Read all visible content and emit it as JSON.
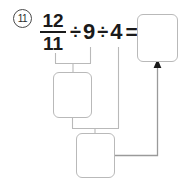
{
  "problem": {
    "number": "11",
    "marker_shape": "circled-number"
  },
  "equation": {
    "fraction": {
      "numerator": "12",
      "denominator": "11"
    },
    "operator_1": "÷",
    "operand_1": "9",
    "operator_2": "÷",
    "operand_2": "4",
    "equals": "="
  },
  "boxes": {
    "answer": {
      "value": "",
      "placeholder": ""
    },
    "step1": {
      "value": "",
      "placeholder": ""
    },
    "step2": {
      "value": "",
      "placeholder": ""
    }
  },
  "colors": {
    "text": "#1a1a1a",
    "marker_border": "#4a4a4a",
    "box_border": "#b9b9b9",
    "connector": "#b9b9b9",
    "arrow": "#1a1a1a",
    "background": "#ffffff"
  }
}
